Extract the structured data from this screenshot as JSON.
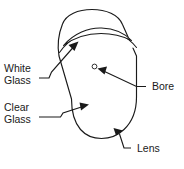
{
  "figure": {
    "type": "technical-illustration",
    "background_color": "#ffffff",
    "line_color": "#1a1a1a"
  },
  "labels": {
    "white_glass": {
      "line1": "White",
      "line2": "Glass",
      "points_to": "top curved band"
    },
    "clear_glass": {
      "line1": "Clear",
      "line2": "Glass",
      "points_to": "main body interior"
    },
    "bore": {
      "text": "Bore",
      "points_to": "small circular hole"
    },
    "lens": {
      "text": "Lens",
      "points_to": "rounded bottom edge"
    }
  },
  "shapes": {
    "body_name": "tapered-rounded-body",
    "band_name": "white-glass-band",
    "bore_name": "bore-hole"
  }
}
